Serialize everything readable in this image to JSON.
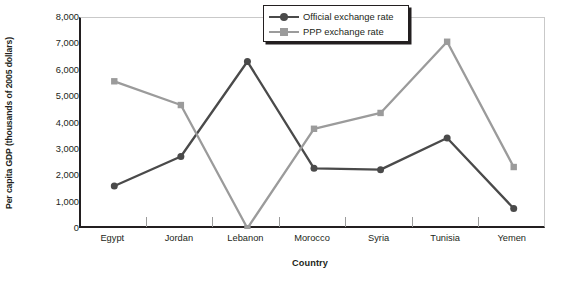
{
  "chart_data": {
    "type": "line",
    "title": "",
    "xlabel": "Country",
    "ylabel": "Per capita GDP (thousands of 2005 dollars)",
    "categories": [
      "Egypt",
      "Jordan",
      "Lebanon",
      "Morocco",
      "Syria",
      "Tunisia",
      "Yemen"
    ],
    "ylim": [
      0,
      8000
    ],
    "yticks": [
      0,
      1000,
      2000,
      3000,
      4000,
      5000,
      6000,
      7000,
      8000
    ],
    "ytick_labels": [
      "0",
      "1,000",
      "2,000",
      "3,000",
      "4,000",
      "5,000",
      "6,000",
      "7,000",
      "8,000"
    ],
    "grid": false,
    "legend_position": "top-center",
    "series": [
      {
        "name": "Official exchange rate",
        "color": "#4a4a4a",
        "marker": "circle",
        "values": [
          1630,
          2750,
          6350,
          2300,
          2250,
          3450,
          780
        ]
      },
      {
        "name": "PPP exchange rate",
        "color": "#9b9b9b",
        "marker": "square",
        "values": [
          5600,
          4700,
          30,
          3800,
          4400,
          7100,
          2350
        ]
      }
    ]
  },
  "legend": {
    "items": [
      {
        "label": "Official exchange rate"
      },
      {
        "label": "PPP exchange rate"
      }
    ]
  },
  "colors": {
    "official": "#4a4a4a",
    "ppp": "#9b9b9b",
    "axis": "#231f20",
    "frame": "#c9c9c9"
  }
}
